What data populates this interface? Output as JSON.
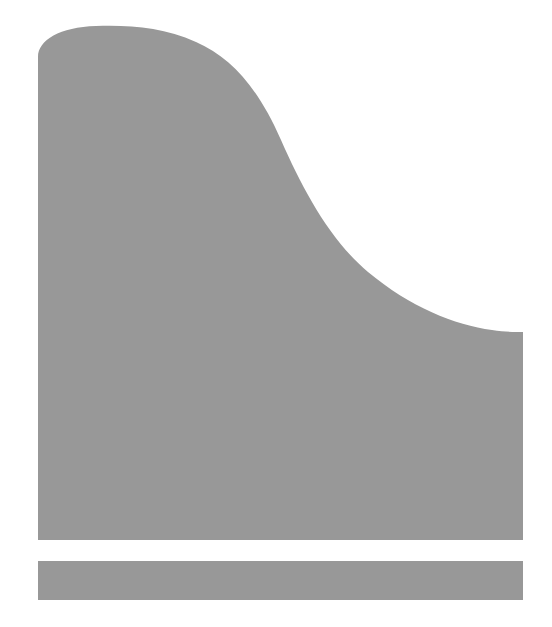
{
  "figure": {
    "title": "Grey silhouette figure",
    "background_color": "#ffffff",
    "fill_color": "#989898",
    "canvas": {
      "width": 552,
      "height": 627
    },
    "shapes": [
      {
        "name": "main-curved-block",
        "description": "Large grey block with a rounded top-left shoulder and an S-shaped curve descending to the right, flat bottom and straight right edge.",
        "fill": "#989898",
        "path": "M 38 540 L 38 57 C 38 40 60 27 96 26 C 130 25 163 27 196 42 C 232 58 258 88 281 140 C 303 190 330 240 368 272 C 410 307 455 325 492 330 C 505 332 515 332 523 332 L 523 540 Z"
      },
      {
        "name": "lower-bar",
        "description": "Separate horizontal grey bar below the main block.",
        "fill": "#989898",
        "x": 38,
        "y": 561,
        "width": 485,
        "height": 39
      }
    ],
    "geometry_notes": {
      "left_edge_x": 38,
      "right_edge_x": 523,
      "main_block_bottom_y": 540,
      "gap_top_y": 540,
      "gap_bottom_y": 561,
      "lower_bar_bottom_y": 600,
      "curve_peak_y": 26,
      "curve_meets_right_edge_y": 332,
      "curve_inflection_point": "295,180"
    }
  }
}
